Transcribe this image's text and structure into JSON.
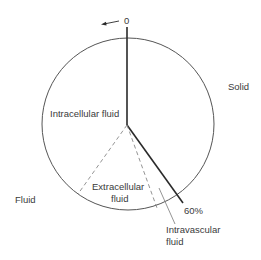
{
  "diagram": {
    "type": "pie-style body composition diagram",
    "labels": {
      "zero": "0",
      "solid": "Solid",
      "intracellular": "Intracellular fluid",
      "extracellular_line1": "Extracellular",
      "extracellular_line2": "fluid",
      "fluid": "Fluid",
      "percent": "60%",
      "intravascular_line1": "Intravascular",
      "intravascular_line2": "fluid"
    },
    "colors": {
      "line": "#2a2a2a",
      "circle": "#555555",
      "dashed": "#888888",
      "text": "#3a3a3a"
    }
  }
}
